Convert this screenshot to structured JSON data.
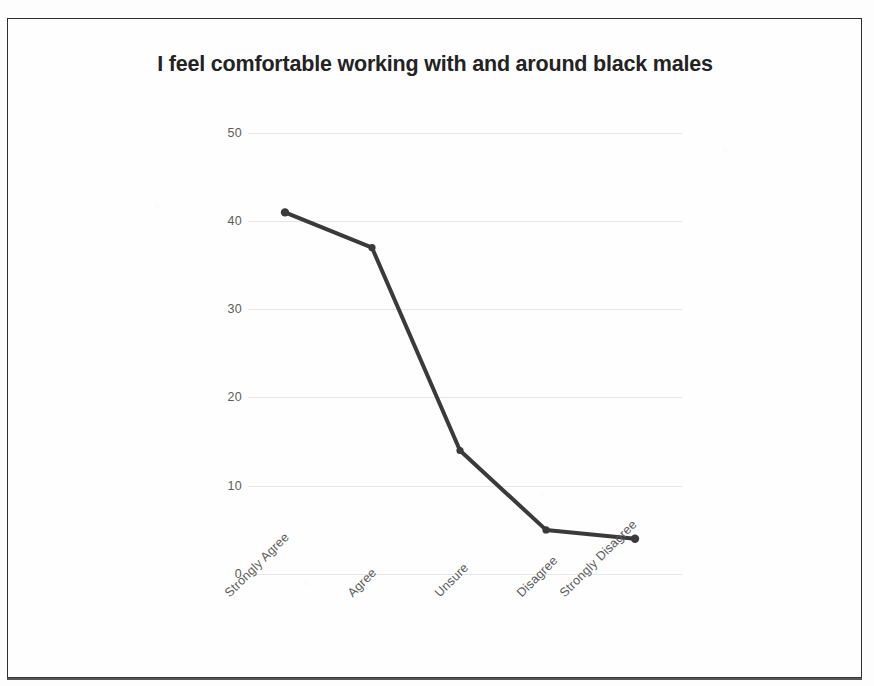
{
  "document": {
    "kind": "scanned-page",
    "border_color": "#2e2e2e",
    "background_color": "#fefefe"
  },
  "chart_data": {
    "type": "line",
    "title": "I feel comfortable working with and around black males",
    "xlabel": "",
    "ylabel": "",
    "categories": [
      "Strongly Agree",
      "Agree",
      "Unsure",
      "Disagree",
      "Strongly Disagree"
    ],
    "values": [
      41,
      37,
      14,
      5,
      4
    ],
    "series": [
      {
        "name": "Responses",
        "values": [
          41,
          37,
          14,
          5,
          4
        ]
      }
    ],
    "ylim": [
      0,
      50
    ],
    "y_ticks": [
      0,
      10,
      20,
      30,
      40,
      50
    ],
    "y_tick_labels": [
      "0",
      "10",
      "20",
      "30",
      "40",
      "50"
    ],
    "grid": true,
    "grid_axis": "y",
    "legend": false,
    "legend_position": "none",
    "markers": true,
    "line_color": "#3a3a3a",
    "marker_color": "#3a3a3a",
    "grid_color": "#e6e6e6",
    "tick_label_color": "#5a5a5a",
    "title_color": "#232323",
    "x_tick_rotation": -45
  }
}
